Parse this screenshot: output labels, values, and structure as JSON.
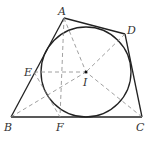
{
  "diagram": {
    "type": "geometry",
    "points": {
      "A": {
        "label": "A",
        "x": 64,
        "y": 18
      },
      "D": {
        "label": "D",
        "x": 125,
        "y": 34
      },
      "B": {
        "label": "B",
        "x": 11,
        "y": 117
      },
      "C": {
        "label": "C",
        "x": 142,
        "y": 117
      },
      "E": {
        "label": "E",
        "x": 34,
        "y": 72
      },
      "F": {
        "label": "F",
        "x": 60,
        "y": 117
      },
      "I": {
        "label": "I",
        "x": 86,
        "y": 72
      }
    },
    "circle": {
      "cx": 86,
      "cy": 72,
      "r": 45
    },
    "solid_edges": [
      "AB",
      "BC",
      "CD",
      "DA"
    ],
    "dashed_segments": [
      "AF",
      "BI",
      "CI",
      "DI",
      "EI",
      "EC",
      "FI"
    ],
    "colors": {
      "stroke": "#222222",
      "dash": "#888888"
    }
  }
}
